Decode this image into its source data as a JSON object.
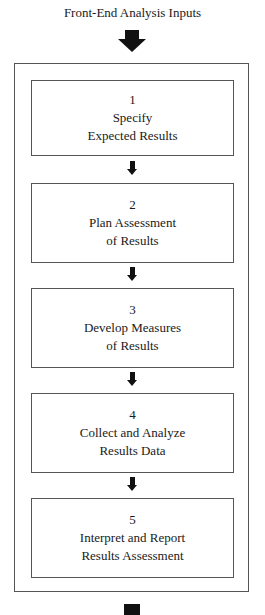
{
  "title": "Front-End Analysis Inputs",
  "steps": [
    {
      "number": "1",
      "line1": "Specify",
      "line2": "Expected Results"
    },
    {
      "number": "2",
      "line1": "Plan Assessment",
      "line2": "of Results"
    },
    {
      "number": "3",
      "line1": "Develop Measures",
      "line2": "of Results"
    },
    {
      "number": "4",
      "line1": "Collect and Analyze",
      "line2": "Results Data"
    },
    {
      "number": "5",
      "line1": "Interpret and Report",
      "line2": "Results Assessment"
    }
  ],
  "colors": {
    "arrow": "#111111",
    "border": "#555555"
  }
}
